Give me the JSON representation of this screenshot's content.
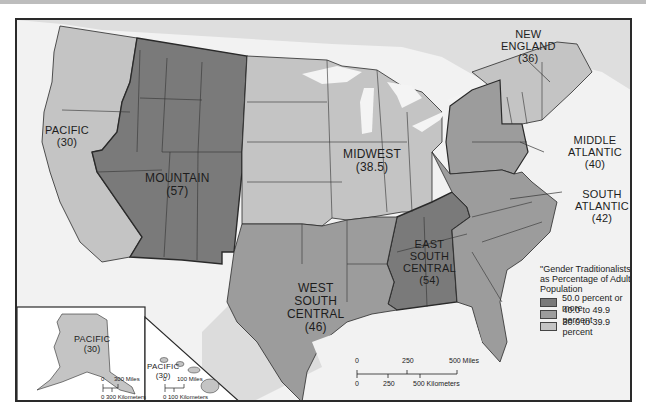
{
  "map": {
    "colors": {
      "high": "#7a7a7a",
      "mid": "#9c9c9c",
      "low": "#c4c4c4",
      "water": "#f4f4f4",
      "background": "#ffffff",
      "border": "#2a2a2a"
    },
    "regions": [
      {
        "name": "PACIFIC",
        "value": "(30)",
        "class": "30.0 to 39.9 percent"
      },
      {
        "name": "MOUNTAIN",
        "value": "(57)",
        "class": "50.0 percent or more"
      },
      {
        "name": "MIDWEST",
        "value": "(38.5)",
        "class": "30.0 to 39.9 percent"
      },
      {
        "name": "NEW ENGLAND",
        "value": "(36)",
        "class": "30.0 to 39.9 percent"
      },
      {
        "name": "MIDDLE ATLANTIC",
        "value": "(40)",
        "class": "40.0 to 49.9 percent"
      },
      {
        "name": "SOUTH ATLANTIC",
        "value": "(42)",
        "class": "40.0 to 49.9 percent"
      },
      {
        "name": "EAST SOUTH CENTRAL",
        "value": "(54)",
        "class": "50.0 percent or more"
      },
      {
        "name": "WEST SOUTH CENTRAL",
        "value": "(46)",
        "class": "40.0 to 49.9 percent"
      }
    ],
    "labels": {
      "pacific": {
        "line1": "PACIFIC",
        "line2": "(30)"
      },
      "mountain": {
        "line1": "MOUNTAIN",
        "line2": "(57)"
      },
      "midwest": {
        "line1": "MIDWEST",
        "line2": "(38.5)"
      },
      "new_england": {
        "line1": "NEW",
        "line2": "ENGLAND",
        "line3": "(36)"
      },
      "middle_atlantic": {
        "line1": "MIDDLE",
        "line2": "ATLANTIC",
        "line3": "(40)"
      },
      "south_atlantic": {
        "line1": "SOUTH",
        "line2": "ATLANTIC",
        "line3": "(42)"
      },
      "east_south_central": {
        "line1": "EAST",
        "line2": "SOUTH",
        "line3": "CENTRAL",
        "line4": "(54)"
      },
      "west_south_central": {
        "line1": "WEST",
        "line2": "SOUTH",
        "line3": "CENTRAL",
        "line4": "(46)"
      },
      "alaska": {
        "line1": "PACIFIC",
        "line2": "(30)"
      },
      "hawaii": {
        "line1": "PACIFIC",
        "line2": "(30)"
      }
    },
    "legend": {
      "title_line1": "\"Gender Traditionalists\"",
      "title_line2": "as Percentage of Adult",
      "title_line3": "Population",
      "items": [
        {
          "label": "50.0 percent or more",
          "color": "#7a7a7a"
        },
        {
          "label": "40.0 to 49.9 percent",
          "color": "#9c9c9c"
        },
        {
          "label": "30.0 to 39.9 percent",
          "color": "#c4c4c4"
        }
      ]
    },
    "scale_main": {
      "miles_0": "0",
      "miles_250": "250",
      "miles_500": "500 Miles",
      "km_0": "0",
      "km_250": "250",
      "km_500": "500 Kilometers"
    },
    "scale_alaska": {
      "miles_0": "0",
      "miles_300": "300 Miles",
      "km": "0  300 Kilometers"
    },
    "scale_hawaii": {
      "miles_0": "0",
      "miles_100": "100 Miles",
      "km": "0  100 Kilometers"
    }
  }
}
